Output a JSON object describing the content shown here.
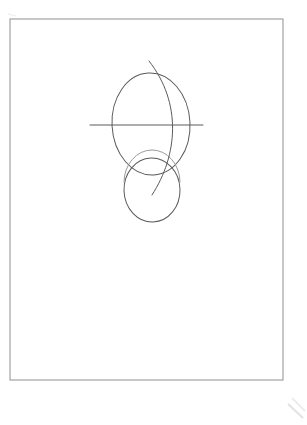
{
  "document": {
    "title": "Scanned pencil sketch",
    "background_color": "#ffffff",
    "width": 307,
    "height": 425
  },
  "page": {
    "name": "paper-sheet",
    "border_color": "#8f8f8f",
    "fill_color": "#ffffff",
    "x": 10,
    "y": 19,
    "width": 273,
    "height": 361,
    "border_width": 1
  },
  "drawing": {
    "name": "construction-sketch",
    "stroke_color": "#5a5a5a",
    "stroke_width": 1,
    "faint_stroke_color": "#9a9a9a",
    "shapes": [
      {
        "name": "large-ellipse",
        "type": "ellipse",
        "cx": 151,
        "cy": 124,
        "rx": 39,
        "ry": 51,
        "rotation": -3
      },
      {
        "name": "small-ellipse",
        "type": "ellipse",
        "cx": 152,
        "cy": 190,
        "rx": 28,
        "ry": 32,
        "rotation": -2
      },
      {
        "name": "horizontal-axis-line",
        "type": "line",
        "x1": 90,
        "y1": 125,
        "x2": 203,
        "y2": 125
      },
      {
        "name": "vertical-center-curve",
        "type": "curve",
        "x1": 149,
        "y1": 61,
        "cx1": 182,
        "cy1": 103,
        "cx2": 178,
        "cy2": 155,
        "x2": 152,
        "y2": 195
      }
    ]
  },
  "artifacts": {
    "name": "scan-edge-artifacts",
    "color": "#e2e2e2",
    "marks": [
      {
        "name": "corner-smudge-bottom-right",
        "x1": 288,
        "y1": 404,
        "x2": 303,
        "y2": 418
      },
      {
        "name": "corner-smudge-bottom-right-secondary",
        "x1": 292,
        "y1": 398,
        "x2": 305,
        "y2": 411
      },
      {
        "name": "corner-smudge-top-left",
        "x1": 8,
        "y1": 14,
        "x2": 16,
        "y2": 16
      }
    ]
  }
}
